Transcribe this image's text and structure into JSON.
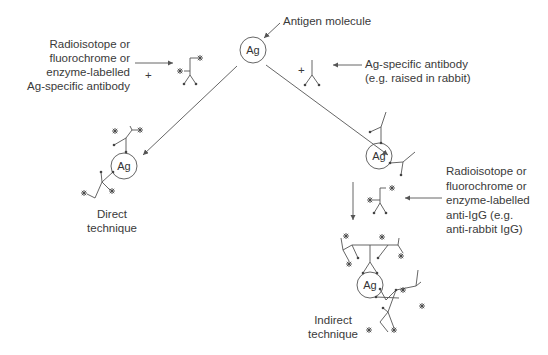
{
  "antigen_label": "Ag",
  "labels": {
    "antigen_molecule": "Antigen molecule",
    "labelled_ab": [
      "Radioisotope or",
      "fluorochrome or",
      "enzyme-labelled",
      "Ag-specific antibody"
    ],
    "unlabelled_ab": [
      "Ag-specific antibody",
      "(e.g. raised in rabbit)"
    ],
    "labelled_anti_igg": [
      "Radioisotope or",
      "fluorochrome or",
      "enzyme-labelled",
      "anti-IgG (e.g.",
      "anti-rabbit IgG)"
    ],
    "direct": [
      "Direct",
      "technique"
    ],
    "indirect": [
      "Indirect",
      "technique"
    ],
    "plus": "+"
  },
  "colors": {
    "line": "#555555",
    "text": "#3a3a3a"
  }
}
